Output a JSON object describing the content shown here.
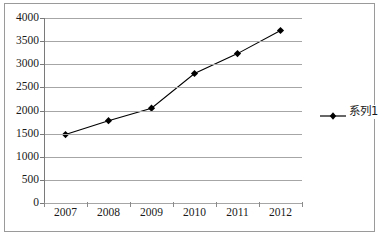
{
  "chart_data": {
    "type": "line",
    "title": "",
    "xlabel": "",
    "ylabel": "",
    "categories": [
      "2007",
      "2008",
      "2009",
      "2010",
      "2011",
      "2012"
    ],
    "series": [
      {
        "name": "系列1",
        "values": [
          1480,
          1780,
          2050,
          2800,
          3230,
          3730
        ],
        "marker": "diamond",
        "color": "#000000"
      }
    ],
    "ylim": [
      0,
      4000
    ],
    "yticks": [
      0,
      500,
      1000,
      1500,
      2000,
      2500,
      3000,
      3500,
      4000
    ],
    "ytick_labels": [
      "0",
      "500",
      "1000",
      "1500",
      "2000",
      "2500",
      "3000",
      "3500",
      "4000"
    ],
    "grid": "horizontal",
    "legend_position": "right",
    "legend_entries": [
      "系列1"
    ],
    "plot_border": "none",
    "chart_border": true,
    "gridline_color": "#a6a6a6",
    "axis_color": "#7a7a7a",
    "background_color": "#ffffff"
  }
}
